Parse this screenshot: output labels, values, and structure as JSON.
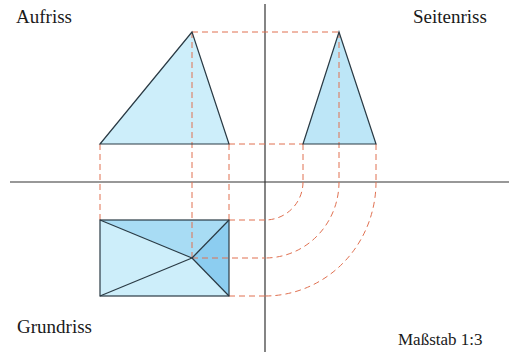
{
  "labels": {
    "front_view": "Aufriss",
    "side_view": "Seitenriss",
    "top_view": "Grundriss",
    "scale": "Maßstab 1:3"
  },
  "colors": {
    "axis": "#333333",
    "dashed": "#e07050",
    "fill_light": "#cdeefa",
    "fill_mid": "#a8dcf4",
    "fill_dark": "#8ccdf0",
    "outline": "#2a3a44"
  },
  "diagram": {
    "axes": {
      "x_axis_y": 182,
      "y_axis_x": 265
    },
    "front_triangle": [
      [
        192,
        32
      ],
      [
        100,
        144
      ],
      [
        229,
        144
      ]
    ],
    "side_triangle": [
      [
        339,
        32
      ],
      [
        303,
        144
      ],
      [
        376,
        144
      ]
    ],
    "top_rect": {
      "x1": 100,
      "y1": 220,
      "x2": 229,
      "y2": 296,
      "apex": [
        192,
        258
      ]
    }
  }
}
